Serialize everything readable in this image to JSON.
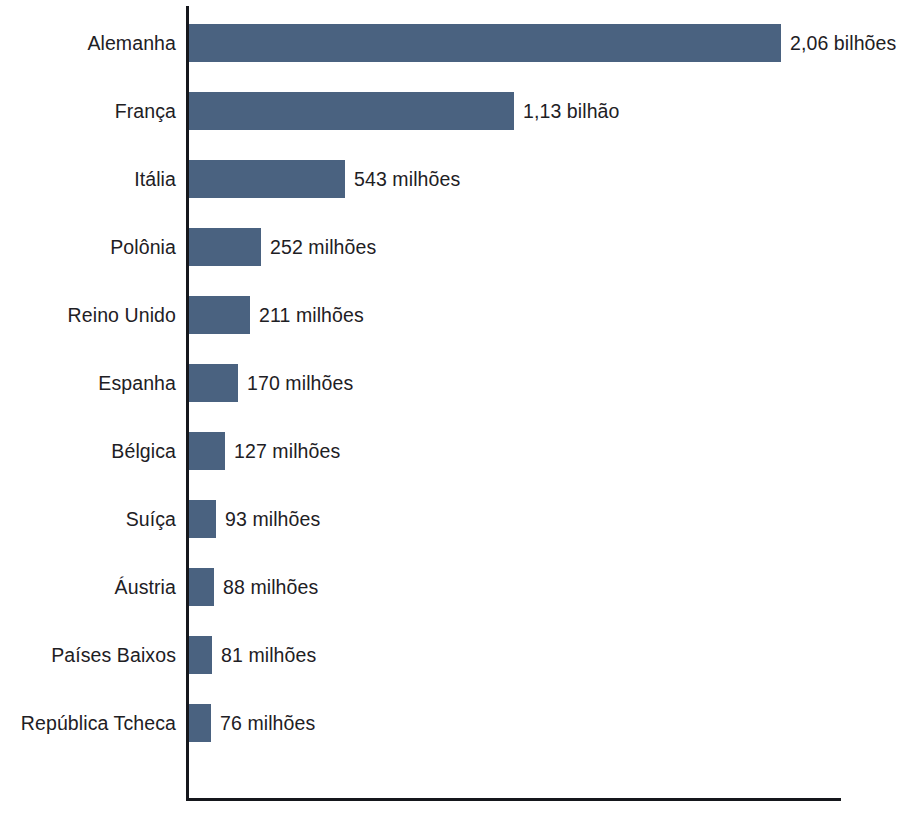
{
  "chart_data": {
    "type": "bar",
    "orientation": "horizontal",
    "title": "",
    "subtitle": "",
    "xlabel": "",
    "ylabel": "",
    "grid": false,
    "legend": false,
    "axis_color": "#15171c",
    "bar_color": "#4a6280",
    "background": "#ffffff",
    "unit_note": "values labelled in Portuguese: 'bilhões' = billions, 'milhões' = millions",
    "xlim": [
      0,
      2060
    ],
    "categories": [
      "Alemanha",
      "França",
      "Itália",
      "Polônia",
      "Reino Unido",
      "Espanha",
      "Bélgica",
      "Suíça",
      "Áustria",
      "Países Baixos",
      "República Tcheca"
    ],
    "values": [
      2060,
      1130,
      543,
      252,
      211,
      170,
      127,
      93,
      88,
      81,
      76
    ],
    "value_labels": [
      "2,06 bilhões",
      "1,13 bilhão",
      "543 milhões",
      "252 milhões",
      "211 milhões",
      "170 milhões",
      "127 milhões",
      "93 milhões",
      "88 milhões",
      "81 milhões",
      "76 milhões"
    ],
    "bars": [
      {
        "label": "Alemanha",
        "value": 2060,
        "value_label": "2,06 bilhões"
      },
      {
        "label": "França",
        "value": 1130,
        "value_label": "1,13 bilhão"
      },
      {
        "label": "Itália",
        "value": 543,
        "value_label": "543 milhões"
      },
      {
        "label": "Polônia",
        "value": 252,
        "value_label": "252 milhões"
      },
      {
        "label": "Reino Unido",
        "value": 211,
        "value_label": "211 milhões"
      },
      {
        "label": "Espanha",
        "value": 170,
        "value_label": "170 milhões"
      },
      {
        "label": "Bélgica",
        "value": 127,
        "value_label": "127 milhões"
      },
      {
        "label": "Suíça",
        "value": 93,
        "value_label": "93 milhões"
      },
      {
        "label": "Áustria",
        "value": 88,
        "value_label": "88 milhões"
      },
      {
        "label": "Países Baixos",
        "value": 81,
        "value_label": "81 milhões"
      },
      {
        "label": "República Tcheca",
        "value": 76,
        "value_label": "76 milhões"
      }
    ]
  },
  "geometry": {
    "row_pitch": 68,
    "first_row_top": 24,
    "bar_height": 38,
    "plot_left": 189,
    "plot_width": 592,
    "min_bar_width": 22
  }
}
